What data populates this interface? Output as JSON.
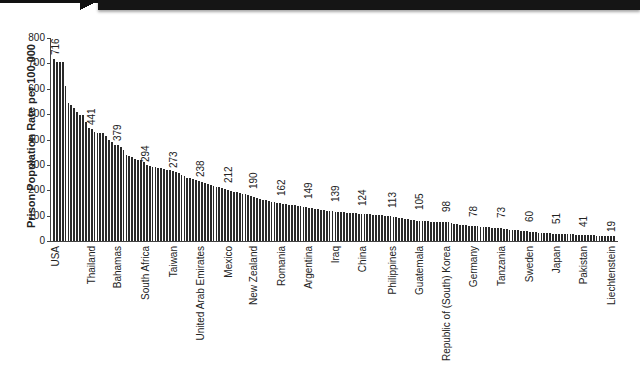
{
  "chart_data": {
    "type": "bar",
    "title": "",
    "xlabel": "",
    "ylabel": "Prison Population Rate per 100,000",
    "ylim": [
      0,
      800
    ],
    "yticks": [
      0,
      100,
      200,
      300,
      400,
      500,
      600,
      700,
      800
    ],
    "grid": false,
    "legend": null,
    "labeled_categories": [
      "USA",
      "Thailand",
      "Bahamas",
      "South Africa",
      "Taiwan",
      "United Arab Emirates",
      "Mexico",
      "New Zealand",
      "Romania",
      "Argentina",
      "Iraq",
      "China",
      "Philippines",
      "Guatemala",
      "Republic of (South) Korea",
      "Germany",
      "Tanzania",
      "Sweden",
      "Japan",
      "Pakistan",
      "Liechtenstein"
    ],
    "labeled_values": [
      716,
      441,
      379,
      294,
      273,
      238,
      212,
      190,
      162,
      149,
      139,
      124,
      113,
      105,
      98,
      78,
      73,
      60,
      51,
      41,
      19
    ],
    "labeled_x_px": [
      56,
      92,
      118,
      146,
      174,
      201,
      229,
      254,
      282,
      309,
      336,
      363,
      393,
      420,
      447,
      474,
      502,
      530,
      557,
      584,
      612
    ],
    "bar_count_approx": 194,
    "profile": [
      [
        0,
        716
      ],
      [
        1,
        705
      ],
      [
        2,
        705
      ],
      [
        3,
        705
      ],
      [
        4,
        610
      ],
      [
        5,
        545
      ],
      [
        6,
        535
      ],
      [
        7,
        525
      ],
      [
        8,
        510
      ],
      [
        9,
        495
      ],
      [
        10,
        495
      ],
      [
        11,
        470
      ],
      [
        12,
        445
      ],
      [
        13,
        441
      ],
      [
        14,
        430
      ],
      [
        15,
        425
      ],
      [
        16,
        425
      ],
      [
        17,
        425
      ],
      [
        18,
        415
      ],
      [
        19,
        400
      ],
      [
        20,
        390
      ],
      [
        21,
        380
      ],
      [
        22,
        379
      ],
      [
        23,
        370
      ],
      [
        24,
        360
      ],
      [
        25,
        340
      ],
      [
        26,
        335
      ],
      [
        27,
        330
      ],
      [
        28,
        325
      ],
      [
        29,
        320
      ],
      [
        30,
        318
      ],
      [
        31,
        310
      ],
      [
        32,
        300
      ],
      [
        33,
        294
      ],
      [
        34,
        290
      ],
      [
        35,
        290
      ],
      [
        36,
        288
      ],
      [
        37,
        287
      ],
      [
        38,
        285
      ],
      [
        39,
        280
      ],
      [
        40,
        278
      ],
      [
        41,
        275
      ],
      [
        42,
        273
      ],
      [
        43,
        268
      ],
      [
        44,
        262
      ],
      [
        45,
        255
      ],
      [
        46,
        250
      ],
      [
        47,
        247
      ],
      [
        48,
        244
      ],
      [
        49,
        240
      ],
      [
        50,
        238
      ],
      [
        51,
        234
      ],
      [
        52,
        230
      ],
      [
        53,
        226
      ],
      [
        54,
        222
      ],
      [
        55,
        218
      ],
      [
        56,
        214
      ],
      [
        57,
        212
      ],
      [
        58,
        208
      ],
      [
        59,
        204
      ],
      [
        60,
        200
      ],
      [
        61,
        198
      ],
      [
        62,
        195
      ],
      [
        63,
        192
      ],
      [
        64,
        190
      ],
      [
        65,
        187
      ],
      [
        66,
        184
      ],
      [
        67,
        180
      ],
      [
        68,
        176
      ],
      [
        69,
        172
      ],
      [
        70,
        168
      ],
      [
        71,
        165
      ],
      [
        72,
        162
      ],
      [
        73,
        160
      ],
      [
        74,
        157
      ],
      [
        75,
        155
      ],
      [
        76,
        152
      ],
      [
        77,
        150
      ],
      [
        78,
        149
      ],
      [
        79,
        147
      ],
      [
        80,
        145
      ],
      [
        81,
        143
      ],
      [
        82,
        142
      ],
      [
        83,
        140
      ],
      [
        84,
        139
      ],
      [
        85,
        137
      ],
      [
        86,
        135
      ],
      [
        87,
        133
      ],
      [
        88,
        131
      ],
      [
        89,
        129
      ],
      [
        90,
        127
      ],
      [
        91,
        125
      ],
      [
        92,
        124
      ],
      [
        93,
        122
      ],
      [
        94,
        120
      ],
      [
        95,
        118
      ],
      [
        96,
        117
      ],
      [
        97,
        116
      ],
      [
        98,
        115
      ],
      [
        99,
        114
      ],
      [
        100,
        113
      ],
      [
        101,
        112
      ],
      [
        102,
        111
      ],
      [
        103,
        110
      ],
      [
        104,
        109
      ],
      [
        105,
        108
      ],
      [
        106,
        107
      ],
      [
        107,
        106
      ],
      [
        108,
        106
      ],
      [
        109,
        105
      ],
      [
        110,
        104
      ],
      [
        111,
        103
      ],
      [
        112,
        102
      ],
      [
        113,
        101
      ],
      [
        114,
        100
      ],
      [
        115,
        99
      ],
      [
        116,
        98
      ],
      [
        117,
        96
      ],
      [
        118,
        94
      ],
      [
        119,
        92
      ],
      [
        120,
        90
      ],
      [
        121,
        88
      ],
      [
        122,
        86
      ],
      [
        123,
        84
      ],
      [
        124,
        82
      ],
      [
        125,
        80
      ],
      [
        126,
        79
      ],
      [
        127,
        78
      ],
      [
        128,
        77
      ],
      [
        129,
        77
      ],
      [
        130,
        76
      ],
      [
        131,
        76
      ],
      [
        132,
        75
      ],
      [
        133,
        75
      ],
      [
        134,
        74
      ],
      [
        135,
        74
      ],
      [
        136,
        73
      ],
      [
        137,
        71
      ],
      [
        138,
        69
      ],
      [
        139,
        67
      ],
      [
        140,
        65
      ],
      [
        141,
        63
      ],
      [
        142,
        62
      ],
      [
        143,
        61
      ],
      [
        144,
        60
      ],
      [
        145,
        59
      ],
      [
        146,
        58
      ],
      [
        147,
        57
      ],
      [
        148,
        56
      ],
      [
        149,
        55
      ],
      [
        150,
        54
      ],
      [
        151,
        53
      ],
      [
        152,
        52
      ],
      [
        153,
        51
      ],
      [
        154,
        50
      ],
      [
        155,
        48
      ],
      [
        156,
        46
      ],
      [
        157,
        44
      ],
      [
        158,
        43
      ],
      [
        159,
        42
      ],
      [
        160,
        42
      ],
      [
        161,
        41
      ],
      [
        162,
        40
      ],
      [
        163,
        38
      ],
      [
        164,
        36
      ],
      [
        165,
        35
      ],
      [
        166,
        34
      ],
      [
        167,
        33
      ],
      [
        168,
        32
      ],
      [
        169,
        31
      ],
      [
        170,
        30
      ],
      [
        171,
        30
      ],
      [
        172,
        29
      ],
      [
        173,
        29
      ],
      [
        174,
        28
      ],
      [
        175,
        28
      ],
      [
        176,
        27
      ],
      [
        177,
        27
      ],
      [
        178,
        26
      ],
      [
        179,
        26
      ],
      [
        180,
        25
      ],
      [
        181,
        25
      ],
      [
        182,
        24
      ],
      [
        183,
        24
      ],
      [
        184,
        23
      ],
      [
        185,
        23
      ],
      [
        186,
        22
      ],
      [
        187,
        21
      ],
      [
        188,
        20
      ],
      [
        189,
        19
      ],
      [
        190,
        19
      ],
      [
        191,
        19
      ],
      [
        192,
        19
      ],
      [
        193,
        19
      ]
    ]
  },
  "header_banner": {
    "color": "#151515"
  },
  "bar_color": "#2a2a2a"
}
